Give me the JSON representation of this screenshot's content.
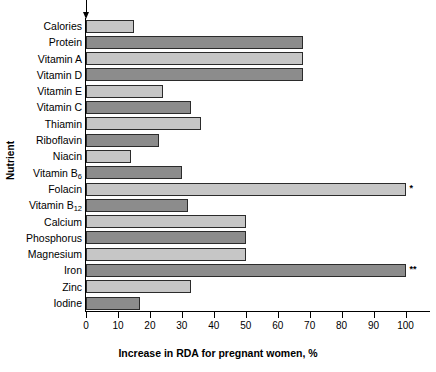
{
  "chart_data": {
    "type": "bar",
    "orientation": "horizontal",
    "title": "",
    "xlabel": "Increase in RDA for pregnant women, %",
    "ylabel": "Nutrient",
    "xlim": [
      0,
      107
    ],
    "xticks": [
      0,
      10,
      20,
      30,
      40,
      50,
      60,
      70,
      80,
      90,
      100
    ],
    "xtick_labels": [
      "0",
      "10",
      "20",
      "30",
      "40",
      "50",
      "60",
      "70",
      "80",
      "90",
      "100"
    ],
    "grid": false,
    "legend": "none",
    "categories": [
      "Calories",
      "Protein",
      "Vitamin A",
      "Vitamin D",
      "Vitamin E",
      "Vitamin C",
      "Thiamin",
      "Riboflavin",
      "Niacin",
      "Vitamin B6",
      "Folacin",
      "Vitamin B12",
      "Calcium",
      "Phosphorus",
      "Magnesium",
      "Iron",
      "Zinc",
      "Iodine"
    ],
    "values": [
      15,
      68,
      68,
      68,
      24,
      33,
      36,
      23,
      14,
      30,
      100,
      32,
      50,
      50,
      50,
      100,
      33,
      17
    ],
    "bars": [
      {
        "label": "Calories",
        "label_html": "Calories",
        "value": 15,
        "shade": "light",
        "note": ""
      },
      {
        "label": "Protein",
        "label_html": "Protein",
        "value": 68,
        "shade": "dark",
        "note": ""
      },
      {
        "label": "Vitamin A",
        "label_html": "Vitamin A",
        "value": 68,
        "shade": "light",
        "note": ""
      },
      {
        "label": "Vitamin D",
        "label_html": "Vitamin D",
        "value": 68,
        "shade": "dark",
        "note": ""
      },
      {
        "label": "Vitamin E",
        "label_html": "Vitamin E",
        "value": 24,
        "shade": "light",
        "note": ""
      },
      {
        "label": "Vitamin C",
        "label_html": "Vitamin C",
        "value": 33,
        "shade": "dark",
        "note": ""
      },
      {
        "label": "Thiamin",
        "label_html": "Thiamin",
        "value": 36,
        "shade": "light",
        "note": ""
      },
      {
        "label": "Riboflavin",
        "label_html": "Riboflavin",
        "value": 23,
        "shade": "dark",
        "note": ""
      },
      {
        "label": "Niacin",
        "label_html": "Niacin",
        "value": 14,
        "shade": "light",
        "note": ""
      },
      {
        "label": "Vitamin B6",
        "label_html": "Vitamin B<sub>6</sub>",
        "value": 30,
        "shade": "dark",
        "note": ""
      },
      {
        "label": "Folacin",
        "label_html": "Folacin",
        "value": 100,
        "shade": "light",
        "note": "*"
      },
      {
        "label": "Vitamin B12",
        "label_html": "Vitamin B<sub>12</sub>",
        "value": 32,
        "shade": "dark",
        "note": ""
      },
      {
        "label": "Calcium",
        "label_html": "Calcium",
        "value": 50,
        "shade": "light",
        "note": ""
      },
      {
        "label": "Phosphorus",
        "label_html": "Phosphorus",
        "value": 50,
        "shade": "dark",
        "note": ""
      },
      {
        "label": "Magnesium",
        "label_html": "Magnesium",
        "value": 50,
        "shade": "light",
        "note": ""
      },
      {
        "label": "Iron",
        "label_html": "Iron",
        "value": 100,
        "shade": "dark",
        "note": "**"
      },
      {
        "label": "Zinc",
        "label_html": "Zinc",
        "value": 33,
        "shade": "light",
        "note": ""
      },
      {
        "label": "Iodine",
        "label_html": "Iodine",
        "value": 17,
        "shade": "dark",
        "note": ""
      }
    ],
    "annotations": [
      {
        "name": "down-arrow-at-zero",
        "type": "arrow",
        "x": 0,
        "direction": "down"
      }
    ],
    "colors": {
      "bar_light": "#c6c6c6",
      "bar_dark": "#8c8c8c",
      "bar_outline": "#2b2b2b",
      "axis": "#000000",
      "background": "#ffffff"
    }
  }
}
